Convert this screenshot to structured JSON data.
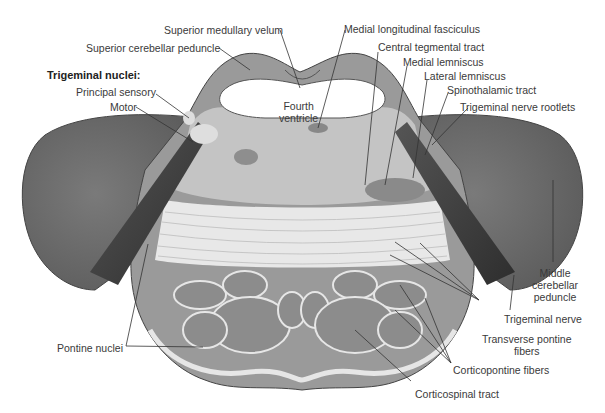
{
  "figure": {
    "group_heading": "Trigeminal nuclei:",
    "labels": {
      "superior_medullary_velum": "Superior medullary velum",
      "superior_cerebellar_peduncle": "Superior cerebellar peduncle",
      "principal_sensory": "Principal sensory",
      "motor": "Motor",
      "fourth_ventricle_1": "Fourth",
      "fourth_ventricle_2": "ventricle",
      "medial_longitudinal_fasciculus": "Medial longitudinal fasciculus",
      "central_tegmental_tract": "Central tegmental tract",
      "medial_lemniscus": "Medial lemniscus",
      "lateral_lemniscus": "Lateral lemniscus",
      "spinothalamic_tract": "Spinothalamic tract",
      "trigeminal_nerve_rootlets": "Trigeminal nerve rootlets",
      "middle_cerebellar_peduncle_1": "Middle",
      "middle_cerebellar_peduncle_2": "cerebellar",
      "middle_cerebellar_peduncle_3": "peduncle",
      "trigeminal_nerve": "Trigeminal nerve",
      "transverse_pontine_fibers_1": "Transverse pontine",
      "transverse_pontine_fibers_2": "fibers",
      "corticopontine_fibers": "Corticopontine fibers",
      "corticospinal_tract": "Corticospinal tract",
      "pontine_nuclei": "Pontine nuclei"
    },
    "colors": {
      "peduncle": "#6e6e6e",
      "tegmentum": "#b8b8b8",
      "basilar": "#8a8a8a",
      "fibers": "#e6e6e6",
      "nerve": "#3c3c3c",
      "leader": "#333333"
    }
  }
}
